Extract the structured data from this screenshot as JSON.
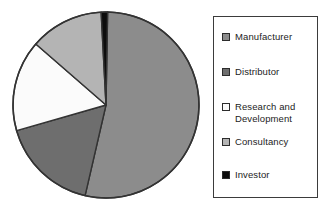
{
  "chart_data": {
    "type": "pie",
    "title": "",
    "subtitle": "",
    "xlabel": "",
    "ylabel": "",
    "grid": false,
    "legend_position": "right",
    "categories": [
      "Manufacturer",
      "Distributor",
      "Research and Development",
      "Consultancy",
      "Investor"
    ],
    "values": [
      52,
      17,
      16,
      14,
      1
    ],
    "units": "percent",
    "start_angle_deg": 0,
    "direction": "clockwise",
    "slices": [
      {
        "label": "Manufacturer",
        "value": 52,
        "color": "#8c8c8c",
        "start_angle_deg": 1,
        "end_angle_deg": 193,
        "swatch": "medium-gray"
      },
      {
        "label": "Distributor",
        "value": 17,
        "color": "#6e6e6e",
        "start_angle_deg": 193,
        "end_angle_deg": 254,
        "swatch": "dark-gray"
      },
      {
        "label": "Research and Development",
        "value": 16,
        "color": "#fbfbfb",
        "start_angle_deg": 254,
        "end_angle_deg": 311,
        "swatch": "white"
      },
      {
        "label": "Consultancy",
        "value": 14,
        "color": "#b4b4b4",
        "start_angle_deg": 311,
        "end_angle_deg": 357,
        "swatch": "light-gray"
      },
      {
        "label": "Investor",
        "value": 1,
        "color": "#0d0d0d",
        "start_angle_deg": 357,
        "end_angle_deg": 361,
        "swatch": "black"
      }
    ]
  },
  "pie": {
    "center_x": 98,
    "center_y": 99,
    "radius": 93,
    "outline_color": "#333333"
  },
  "legend": {
    "border_color": "#3b3b3b",
    "background": "#ffffff",
    "items": [
      {
        "label": "Manufacturer",
        "color": "#8c8c8c"
      },
      {
        "label": "Distributor",
        "color": "#6e6e6e"
      },
      {
        "label": "Research and\nDevelopment",
        "color": "#fbfbfb"
      },
      {
        "label": "Consultancy",
        "color": "#b4b4b4"
      },
      {
        "label": "Investor",
        "color": "#0d0d0d"
      }
    ]
  }
}
